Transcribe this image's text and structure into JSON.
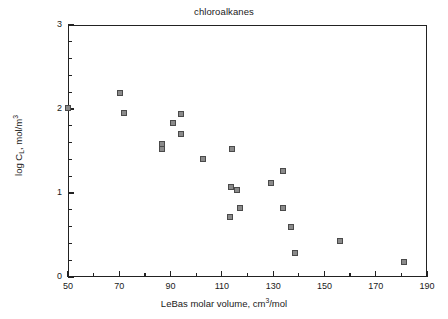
{
  "chart_data": {
    "type": "scatter",
    "title": "chloroalkanes",
    "xlabel": "LeBas molar volume, cm3/mol",
    "xlabel_parts": {
      "pre": "LeBas molar volume, cm",
      "sup": "3",
      "post": "/mol"
    },
    "ylabel": "log CL, mol/m3",
    "ylabel_parts": {
      "pre": "log C",
      "sub": "L",
      "mid": ",  mol/m",
      "sup": "3"
    },
    "xlim": [
      50,
      190
    ],
    "ylim": [
      0,
      3
    ],
    "xticks": [
      50,
      70,
      90,
      110,
      130,
      150,
      170,
      190
    ],
    "yticks": [
      0,
      1,
      2,
      3
    ],
    "x_minor_step": 10,
    "y_minor_step": 0.2,
    "grid": false,
    "legend": null,
    "marker": {
      "shape": "square",
      "fill": "#8a8a8a",
      "edge": "#4a4a4a",
      "size_px": 6
    },
    "series": [
      {
        "name": "chloroalkanes",
        "points": [
          {
            "x": 50.0,
            "y": 2.01
          },
          {
            "x": 70.2,
            "y": 2.19
          },
          {
            "x": 72.0,
            "y": 1.95
          },
          {
            "x": 86.5,
            "y": 1.58
          },
          {
            "x": 86.5,
            "y": 1.52
          },
          {
            "x": 91.0,
            "y": 1.83
          },
          {
            "x": 94.0,
            "y": 1.94
          },
          {
            "x": 94.0,
            "y": 1.7
          },
          {
            "x": 102.5,
            "y": 1.4
          },
          {
            "x": 114.0,
            "y": 1.52
          },
          {
            "x": 113.5,
            "y": 1.07
          },
          {
            "x": 116.0,
            "y": 1.04
          },
          {
            "x": 113.0,
            "y": 0.72
          },
          {
            "x": 117.0,
            "y": 0.82
          },
          {
            "x": 129.0,
            "y": 1.12
          },
          {
            "x": 134.0,
            "y": 1.26
          },
          {
            "x": 134.0,
            "y": 0.82
          },
          {
            "x": 137.0,
            "y": 0.6
          },
          {
            "x": 138.5,
            "y": 0.29
          },
          {
            "x": 156.0,
            "y": 0.43
          },
          {
            "x": 181.0,
            "y": 0.18
          }
        ]
      }
    ]
  },
  "axis": {
    "x_tick_labels": [
      "50",
      "70",
      "90",
      "110",
      "130",
      "150",
      "170",
      "190"
    ],
    "y_tick_labels": [
      "0",
      "1",
      "2",
      "3"
    ]
  }
}
